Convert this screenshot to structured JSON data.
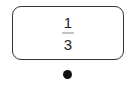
{
  "card": {
    "fraction": {
      "numerator": "1",
      "denominator": "3"
    }
  },
  "connector": {
    "icon": "dot-icon",
    "color": "#111111"
  },
  "colors": {
    "border": "#333333",
    "text": "#222222",
    "fraction_bar": "#888888"
  }
}
